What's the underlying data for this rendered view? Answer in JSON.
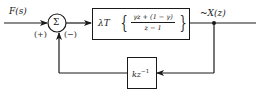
{
  "diagram": {
    "input_label": "F(s)",
    "summing_junction": {
      "symbol": "Σ",
      "plus_sign": "(+)",
      "minus_sign": "(−)"
    },
    "forward_block": {
      "gain": "λT",
      "numerator": "γz + (1 − γ)",
      "denominator": "z − 1",
      "left_brace": "{",
      "right_brace": "}"
    },
    "output_label": "~X(z)",
    "feedback_block": {
      "label_base": "kz",
      "label_exp": "−1"
    },
    "colors": {
      "stroke": "#1a1a1a",
      "background": "#ffffff"
    }
  }
}
